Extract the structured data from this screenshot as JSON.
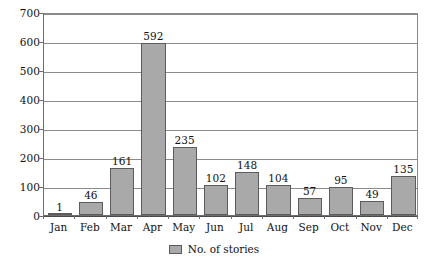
{
  "chart_data": {
    "type": "bar",
    "title": "",
    "subtitle": "",
    "xlabel": "",
    "ylabel": "",
    "categories": [
      "Jan",
      "Feb",
      "Mar",
      "Apr",
      "May",
      "Jun",
      "Jul",
      "Aug",
      "Sep",
      "Oct",
      "Nov",
      "Dec"
    ],
    "values": [
      1,
      46,
      161,
      592,
      235,
      102,
      148,
      104,
      57,
      95,
      49,
      135
    ],
    "series": [
      {
        "name": "No. of stories",
        "values": [
          1,
          46,
          161,
          592,
          235,
          102,
          148,
          104,
          57,
          95,
          49,
          135
        ]
      }
    ],
    "ylim": [
      0,
      700
    ],
    "ytick_step": 100,
    "yticks": [
      0,
      100,
      200,
      300,
      400,
      500,
      600,
      700
    ],
    "ytick_labels": [
      "0",
      "100",
      "200",
      "300",
      "400",
      "500",
      "600",
      "700"
    ],
    "grid": "horizontal",
    "show_value_labels": true,
    "legend": {
      "position": "bottom-center",
      "entries": [
        {
          "label": "No. of stories",
          "color": "#a9a9a9"
        }
      ]
    },
    "colors": {
      "bar_fill": "#a9a9a9",
      "bar_border": "#5c5c5c",
      "gridline": "#8b8b8b",
      "axis": "#6e6e6e",
      "background": "#ffffff",
      "text": "#111111"
    }
  }
}
